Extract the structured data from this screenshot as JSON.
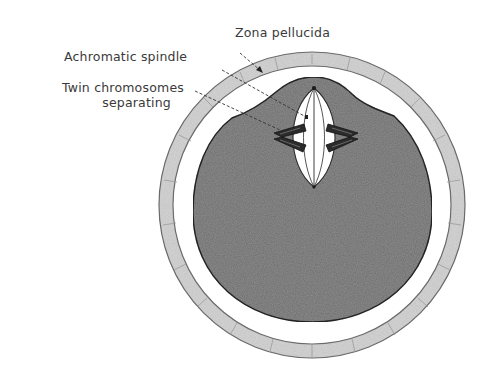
{
  "figure": {
    "labels": {
      "zona_pellucida": "Zona pellucida",
      "achromatic_spindle": "Achromatic spindle",
      "twin_chromosomes_line1": "Twin chromosomes",
      "twin_chromosomes_line2": "separating"
    },
    "colors": {
      "background": "#ffffff",
      "zona_fill": "#d6d6d6",
      "zona_stroke": "#6a6a6a",
      "cytoplasm_fill": "#8e8e8e",
      "cytoplasm_stroke": "#2a2a2a",
      "spindle_fill": "#ffffff",
      "chromosome_fill": "#2b2b2b",
      "text": "#3a3a3a",
      "leader": "#333333"
    }
  }
}
